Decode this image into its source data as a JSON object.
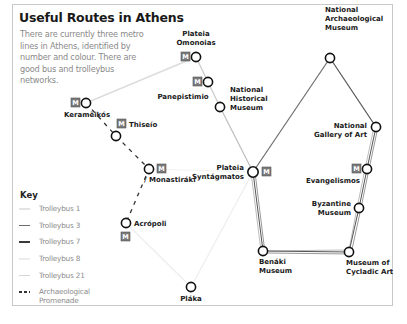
{
  "title": "Useful Routes in Athens",
  "intro": "There are currently three metro lines in Athens, identified by number and colour. There are good bus and trolleybus networks.",
  "colors": {
    "frame": "#c8c8c8",
    "trolleybus_1": "#e6e6e6",
    "trolleybus_3": "#6d6d6d",
    "trolleybus_7": "#3a3a3a",
    "trolleybus_8": "#ededed",
    "trolleybus_21": "#d9d9d9",
    "promenade": "#333333",
    "metro_icon": "#7a7a7a",
    "station_stroke": "#111111"
  },
  "key": {
    "title": "Key",
    "items": [
      {
        "label": "Trolleybus 1",
        "style": "solid",
        "color": "#e3e3e3"
      },
      {
        "label": "Trolleybus 3",
        "style": "solid",
        "color": "#6d6d6d"
      },
      {
        "label": "Trolleybus 7",
        "style": "solid",
        "color": "#3a3a3a"
      },
      {
        "label": "Trolleybus 8",
        "style": "solid",
        "color": "#ececec"
      },
      {
        "label": "Trolleybus 21",
        "style": "solid",
        "color": "#d6d6d6"
      },
      {
        "label": "Archaeological Promenade",
        "style": "dashed",
        "color": "#333333"
      }
    ]
  },
  "metro_icon_label": "M",
  "stations": [
    {
      "id": "omonoias",
      "name": "Plateia Omonoias",
      "lines": [
        "Plateia",
        "Omonoias"
      ],
      "x": 196,
      "y": 57,
      "metro": true
    },
    {
      "id": "panepistimio",
      "name": "Panepistimio",
      "lines": [
        "Panepistimio"
      ],
      "x": 208,
      "y": 82,
      "metro": true
    },
    {
      "id": "historical",
      "name": "National Historical Museum",
      "lines": [
        "National",
        "Historical",
        "Museum"
      ],
      "x": 220,
      "y": 107,
      "metro": false
    },
    {
      "id": "syntagmatos",
      "name": "Plateia Syntágmatos",
      "lines": [
        "Plateia",
        "Syntágmatos"
      ],
      "x": 253,
      "y": 172,
      "metro": true
    },
    {
      "id": "archaeological",
      "name": "National Archaeological Museum",
      "lines": [
        "National",
        "Archaeological",
        "Museum"
      ],
      "x": 330,
      "y": 58,
      "metro": false
    },
    {
      "id": "gallery",
      "name": "National Gallery of Art",
      "lines": [
        "National",
        "Gallery of Art"
      ],
      "x": 376,
      "y": 127,
      "metro": false
    },
    {
      "id": "evangelismos",
      "name": "Evangelismos",
      "lines": [
        "Evangelismos"
      ],
      "x": 367,
      "y": 169,
      "metro": true
    },
    {
      "id": "byzantine",
      "name": "Byzantine Museum",
      "lines": [
        "Byzantine",
        "Museum"
      ],
      "x": 359,
      "y": 208,
      "metro": false
    },
    {
      "id": "cycladic",
      "name": "Museum of Cycladic Art",
      "lines": [
        "Museum of",
        "Cycladic Art"
      ],
      "x": 349,
      "y": 252,
      "metro": false
    },
    {
      "id": "benaki",
      "name": "Benáki Museum",
      "lines": [
        "Benáki",
        "Museum"
      ],
      "x": 263,
      "y": 251,
      "metro": false
    },
    {
      "id": "kerameikos",
      "name": "Keramëikós",
      "lines": [
        "Keramëikós"
      ],
      "x": 86,
      "y": 103,
      "metro": true
    },
    {
      "id": "thiseio",
      "name": "Thiseío",
      "lines": [
        "Thiseío"
      ],
      "x": 116,
      "y": 136,
      "metro": true
    },
    {
      "id": "monastiraki",
      "name": "Monastiráki",
      "lines": [
        "/ Monastiráki"
      ],
      "x": 149,
      "y": 169,
      "metro": true
    },
    {
      "id": "acropoli",
      "name": "Acrópoli",
      "lines": [
        "Acrópoli"
      ],
      "x": 126,
      "y": 223,
      "metro": true
    },
    {
      "id": "plaka",
      "name": "Pláka",
      "lines": [
        "Pláka"
      ],
      "x": 191,
      "y": 287,
      "metro": false
    }
  ]
}
